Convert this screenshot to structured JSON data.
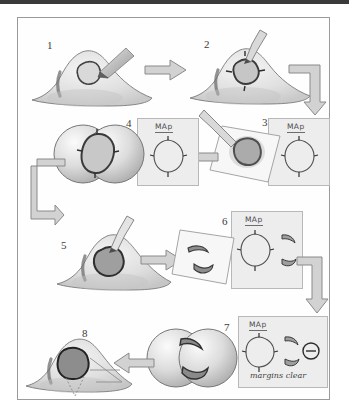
{
  "figure": {
    "width": 349,
    "height": 419,
    "border_color": "#9a9a9a",
    "background": "#ffffff"
  },
  "steps": [
    {
      "number": "1",
      "name": "lesion-marked-on-nose",
      "description": "Nose profile with pigmented lesion outlined by marking pen"
    },
    {
      "number": "2",
      "name": "scalpel-incision-with-score-marks",
      "description": "Scalpel incising around lesion with orientation score marks"
    },
    {
      "number": "3",
      "name": "specimen-on-gauze",
      "description": "Excised specimen placed on gauze beside scalpel"
    },
    {
      "number": "4",
      "name": "microscope-view-whole-specimen",
      "description": "Binocular microscope field showing whole specimen"
    },
    {
      "number": "5",
      "name": "second-stage-excision",
      "description": "Second stage excision of residual tumor on nose"
    },
    {
      "number": "6",
      "name": "sectioned-specimen-on-gauze",
      "description": "Specimen divided into two crescent sections on gauze"
    },
    {
      "number": "7",
      "name": "microscope-view-sections-clear",
      "description": "Microscope field showing both crescent sections free of tumor"
    },
    {
      "number": "8",
      "name": "final-defect-with-repair-plan",
      "description": "Final surgical defect with dotted planned repair lines"
    }
  ],
  "map_cards": [
    {
      "id": "map-card-3",
      "label": "MAp",
      "note": ""
    },
    {
      "id": "map-card-4",
      "label": "MAp",
      "note": ""
    },
    {
      "id": "map-card-6",
      "label": "MAp",
      "note": ""
    },
    {
      "id": "map-card-7",
      "label": "MAp",
      "note": "margins clear"
    }
  ],
  "annotations": {
    "margins_clear": "margins clear",
    "map_label": "MAp",
    "negative_margin_symbol": "⊖"
  },
  "arrows": [
    {
      "name": "arrow-step1-to-step2",
      "direction": "right"
    },
    {
      "name": "arrow-step2-to-step3",
      "direction": "elbow-right-down"
    },
    {
      "name": "arrow-step3-to-step4",
      "direction": "left"
    },
    {
      "name": "arrow-step4-to-step5",
      "direction": "elbow-left-down"
    },
    {
      "name": "arrow-step5-to-step6",
      "direction": "right"
    },
    {
      "name": "arrow-step6-to-step7",
      "direction": "elbow-right-down"
    },
    {
      "name": "arrow-step7-to-step8",
      "direction": "left"
    }
  ],
  "colors": {
    "arrow_fill": "#d2d2d2",
    "arrow_stroke": "#8a8a8a",
    "card_fill": "#ededed",
    "card_stroke": "#b8b8b8",
    "skin_light": "#efefef",
    "skin_mid": "#d6d6d6",
    "lesion_dark": "#6a6a6a",
    "ink": "#3c3c3c"
  }
}
